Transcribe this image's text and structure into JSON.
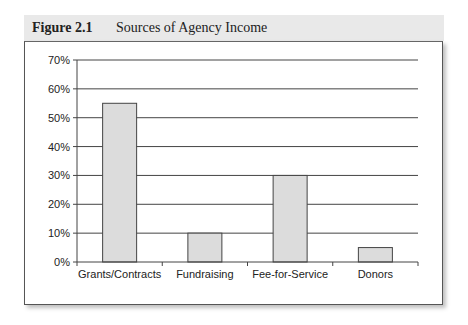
{
  "figure": {
    "number": "Figure 2.1",
    "title": "Sources of Agency Income"
  },
  "colors": {
    "bar_fill": "#dcdcdc",
    "bar_stroke": "#444444",
    "gridline": "#444444",
    "header_bg": "#e9e9e9"
  },
  "chart_data": {
    "type": "bar",
    "title": "Sources of Agency Income",
    "xlabel": "",
    "ylabel": "",
    "categories": [
      "Grants/Contracts",
      "Fundraising",
      "Fee-for-Service",
      "Donors"
    ],
    "values": [
      55,
      10,
      30,
      5
    ],
    "unit": "%",
    "ylim": [
      0,
      70
    ],
    "yticks": [
      0,
      10,
      20,
      30,
      40,
      50,
      60,
      70
    ],
    "ytick_labels": [
      "0%",
      "10%",
      "20%",
      "30%",
      "40%",
      "50%",
      "60%",
      "70%"
    ],
    "grid": true,
    "legend": "none"
  }
}
